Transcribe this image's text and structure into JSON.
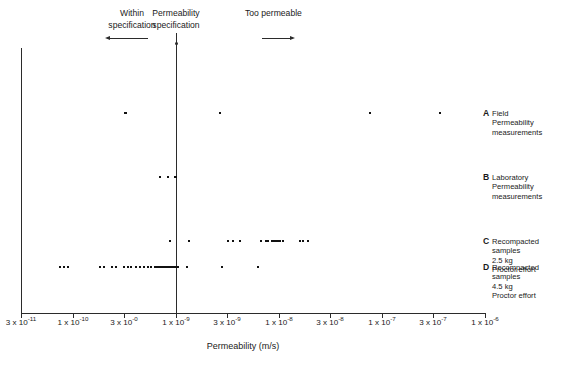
{
  "chart_data": {
    "type": "scatter",
    "title": "",
    "xlabel": "Permeability (m/s)",
    "ylabel": "",
    "xscale": "log",
    "grid": false,
    "legend_position": "right",
    "x_tick_labels": [
      "3 x 10-11",
      "1 x 10-10",
      "3 x 10-0",
      "1 x 10-9",
      "3 x 10-9",
      "1 x 10-8",
      "3 x 10-8",
      "1 x 10-7",
      "3 x 10-7",
      "1 x 10-6"
    ],
    "x_ticks": [
      {
        "mantissa": "3",
        "exponent": "-11",
        "px": 21
      },
      {
        "mantissa": "1",
        "exponent": "-10",
        "px": 73
      },
      {
        "mantissa": "3",
        "exponent": "-0",
        "px": 124
      },
      {
        "mantissa": "1",
        "exponent": "-9",
        "px": 176
      },
      {
        "mantissa": "3",
        "exponent": "-9",
        "px": 227
      },
      {
        "mantissa": "1",
        "exponent": "-8",
        "px": 279
      },
      {
        "mantissa": "3",
        "exponent": "-8",
        "px": 330
      },
      {
        "mantissa": "1",
        "exponent": "-7",
        "px": 382
      },
      {
        "mantissa": "3",
        "exponent": "-7",
        "px": 433
      },
      {
        "mantissa": "1",
        "exponent": "-6",
        "px": 485
      }
    ],
    "annotations": [
      {
        "id": "within",
        "text": "Within specification",
        "line1": "Within",
        "line2": "specification",
        "arrow": "left"
      },
      {
        "id": "specification",
        "text": "Permeability specification",
        "line1": "Permeability",
        "line2": "specification",
        "arrow": "down"
      },
      {
        "id": "too-permeable",
        "text": "Too permeable",
        "line1": "Too permeable",
        "line2": "",
        "arrow": "right"
      }
    ],
    "reference_line": {
      "label": "Permeability specification",
      "value": "1 x 10-9",
      "px": 176
    },
    "series": [
      {
        "key": "A",
        "name": "Field Permeability measurements",
        "line1": "Field",
        "line2": "Permeability",
        "line3": "measurements",
        "line4": "",
        "row_px": 113,
        "count": 5,
        "values_px": [
          125,
          126,
          220,
          370,
          440
        ]
      },
      {
        "key": "B",
        "name": "Laboratory Permeability measurements",
        "line1": "Laboratory",
        "line2": "Permeability",
        "line3": "measurements",
        "line4": "",
        "row_px": 177,
        "count": 5,
        "values_px": [
          160,
          168,
          175,
          176,
          176
        ]
      },
      {
        "key": "C",
        "name": "Recompacted samples 2.5 kg Proctor effort",
        "line1": "Recompacted",
        "line2": "samples",
        "line3": "2.5 kg",
        "line4": "Proctor effort",
        "row_px": 241,
        "count": 17,
        "values_px": [
          170,
          189,
          228,
          233,
          240,
          261,
          266,
          268,
          272,
          274,
          276,
          278,
          280,
          283,
          300,
          303,
          308
        ]
      },
      {
        "key": "D",
        "name": "Recompacted samples 4.5 kg Proctor effort",
        "line1": "Recompacted",
        "line2": "samples",
        "line3": "4.5 kg",
        "line4": "Proctor effort",
        "row_px": 267,
        "count": 36,
        "values_px": [
          60,
          64,
          68,
          100,
          104,
          112,
          116,
          124,
          128,
          131,
          136,
          140,
          144,
          148,
          151,
          155,
          157,
          159,
          161,
          162,
          164,
          165,
          167,
          168,
          169,
          170,
          171,
          172,
          173,
          174,
          175,
          176,
          178,
          187,
          222,
          258
        ]
      }
    ]
  },
  "axis": {
    "title": "Permeability (m/s)"
  },
  "colors": {
    "ink": "#1a1a1a",
    "axis": "#2b2b2b",
    "marker": "#111111",
    "background": "#ffffff"
  }
}
